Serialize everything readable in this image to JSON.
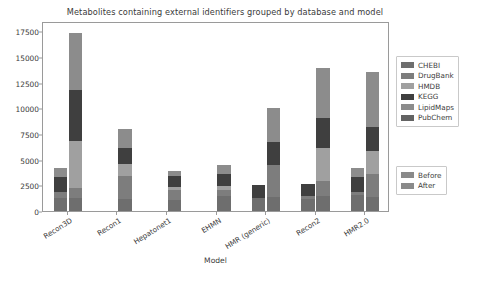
{
  "chart_data": {
    "type": "bar",
    "subtype": "stacked-grouped",
    "title": "Metabolites containing external identifiers grouped by database and model",
    "xlabel": "Model",
    "ylabel": "",
    "ylim": [
      0,
      18500
    ],
    "yticks": [
      0,
      2500,
      5000,
      7500,
      10000,
      12500,
      15000,
      17500
    ],
    "ytick_labels": [
      "0",
      "2500",
      "5000",
      "7500",
      "10000",
      "12500",
      "15000",
      "17500"
    ],
    "grid": false,
    "legend_position": "right",
    "categories": [
      "Recon3D",
      "Recon1",
      "Hepatonet1",
      "EHMN",
      "HMR (generic)",
      "Recon2",
      "HMR2.0"
    ],
    "stack_order": [
      "CHEBI",
      "DrugBank",
      "HMDB",
      "KEGG",
      "LipidMaps",
      "PubChem"
    ],
    "group_labels": [
      "Before",
      "After"
    ],
    "series": [
      {
        "name": "CHEBI",
        "color": "#6e6e6e",
        "before": [
          1300,
          0,
          0,
          0,
          1250,
          1200,
          1600
        ],
        "after": [
          1250,
          1150,
          1050,
          1450,
          1350,
          1450,
          1400
        ]
      },
      {
        "name": "DrugBank",
        "color": "#7d7d7d",
        "before": [
          550,
          0,
          0,
          0,
          0,
          250,
          250
        ],
        "after": [
          950,
          2250,
          950,
          600,
          3100,
          1500,
          2200
        ]
      },
      {
        "name": "HMDB",
        "color": "#a0a0a0",
        "before": [
          0,
          0,
          0,
          0,
          0,
          0,
          0
        ],
        "after": [
          4600,
          1200,
          350,
          350,
          0,
          3200,
          2200
        ]
      },
      {
        "name": "KEGG",
        "color": "#3f3f3f",
        "before": [
          1500,
          0,
          0,
          0,
          1300,
          1200,
          1500
        ],
        "after": [
          4950,
          1550,
          1100,
          1250,
          2250,
          2900,
          2400
        ]
      },
      {
        "name": "LipidMaps",
        "color": "#8c8c8c",
        "before": [
          800,
          0,
          0,
          0,
          0,
          0,
          800
        ],
        "after": [
          5550,
          1800,
          450,
          850,
          3300,
          4900,
          5300
        ]
      },
      {
        "name": "PubChem",
        "color": "#636363",
        "before": [
          0,
          0,
          0,
          0,
          0,
          0,
          0
        ],
        "after": [
          0,
          0,
          0,
          0,
          0,
          0,
          0
        ]
      }
    ],
    "totals_before": [
      4150,
      0,
      0,
      0,
      2550,
      2650,
      4150
    ],
    "totals_after": [
      17300,
      7950,
      3900,
      4500,
      10000,
      13950,
      13500
    ]
  },
  "legends": {
    "database": {
      "items": [
        {
          "label": "CHEBI",
          "color": "#6e6e6e"
        },
        {
          "label": "DrugBank",
          "color": "#7d7d7d"
        },
        {
          "label": "HMDB",
          "color": "#a0a0a0"
        },
        {
          "label": "KEGG",
          "color": "#3f3f3f"
        },
        {
          "label": "LipidMaps",
          "color": "#8c8c8c"
        },
        {
          "label": "PubChem",
          "color": "#636363"
        }
      ]
    },
    "style": {
      "items": [
        {
          "label": "Before",
          "color": "#8a8a8a",
          "hatch": false
        },
        {
          "label": "After",
          "color": "#8a8a8a",
          "hatch": true
        }
      ]
    }
  },
  "colors": {
    "axis": "#9a9a9a",
    "text": "#3c3c3c",
    "background": "#ffffff"
  }
}
